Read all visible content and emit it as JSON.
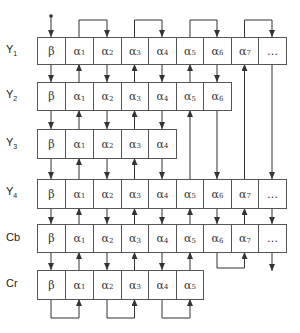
{
  "diagram": {
    "rows": [
      {
        "label": "Y",
        "sub": "1",
        "cells": [
          "β",
          "α1",
          "α2",
          "α3",
          "α4",
          "α5",
          "α6",
          "α7",
          "..."
        ]
      },
      {
        "label": "Y",
        "sub": "2",
        "cells": [
          "β",
          "α1",
          "α2",
          "α3",
          "α4",
          "α5",
          "α6"
        ]
      },
      {
        "label": "Y",
        "sub": "3",
        "cells": [
          "β",
          "α1",
          "α2",
          "α3",
          "α4"
        ]
      },
      {
        "label": "Y",
        "sub": "4",
        "cells": [
          "β",
          "α1",
          "α2",
          "α3",
          "α4",
          "α5",
          "α6",
          "α7",
          "..."
        ]
      },
      {
        "label": "Cb",
        "sub": "",
        "cells": [
          "β",
          "α1",
          "α2",
          "α3",
          "α4",
          "α5",
          "α6",
          "α7",
          "..."
        ]
      },
      {
        "label": "Cr",
        "sub": "",
        "cells": [
          "β",
          "α1",
          "α2",
          "α3",
          "α4",
          "α5"
        ]
      }
    ],
    "colors": {
      "line": "#333333",
      "border": "#555555",
      "background": "#ffffff"
    }
  }
}
